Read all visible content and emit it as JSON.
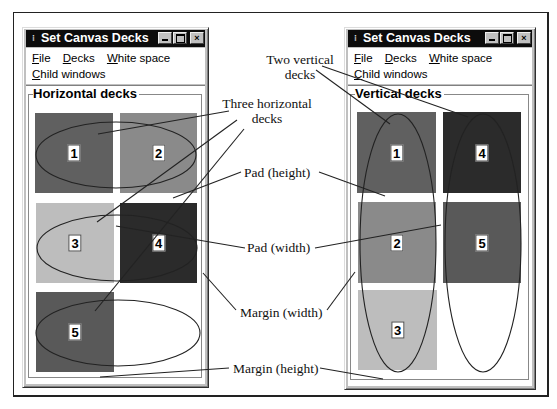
{
  "windows": {
    "left": {
      "title": "Set Canvas Decks",
      "menu": {
        "row1": [
          {
            "label": "File",
            "mnemonic": "F",
            "rest": "ile"
          },
          {
            "label": "Decks",
            "mnemonic": "D",
            "rest": "ecks"
          },
          {
            "label": "White space",
            "mnemonic": "W",
            "rest": "hite space"
          }
        ],
        "row2": [
          {
            "label": "Child windows",
            "mnemonic": "C",
            "rest": "hild windows"
          }
        ]
      },
      "group_label": "Horizontal decks",
      "decks": [
        {
          "num": "1",
          "color": "#606060"
        },
        {
          "num": "2",
          "color": "#8a8a8a"
        },
        {
          "num": "3",
          "color": "#bdbdbd"
        },
        {
          "num": "4",
          "color": "#2b2b2b"
        },
        {
          "num": "5",
          "color": "#595959"
        }
      ]
    },
    "right": {
      "title": "Set Canvas Decks",
      "menu": {
        "row1": [
          {
            "label": "File",
            "mnemonic": "F",
            "rest": "ile"
          },
          {
            "label": "Decks",
            "mnemonic": "D",
            "rest": "ecks"
          },
          {
            "label": "White space",
            "mnemonic": "W",
            "rest": "hite space"
          }
        ],
        "row2": [
          {
            "label": "Child windows",
            "mnemonic": "C",
            "rest": "hild windows"
          }
        ]
      },
      "group_label": "Vertical decks",
      "decks": [
        {
          "num": "1",
          "color": "#606060"
        },
        {
          "num": "4",
          "color": "#2b2b2b"
        },
        {
          "num": "2",
          "color": "#8a8a8a"
        },
        {
          "num": "5",
          "color": "#595959"
        },
        {
          "num": "3",
          "color": "#bdbdbd"
        }
      ]
    }
  },
  "titlebar_buttons": {
    "minimize": "minimize-icon",
    "maximize": "maximize-icon",
    "close": "×"
  },
  "annotations": {
    "two_vertical_1": "Two vertical",
    "two_vertical_2": "decks",
    "three_horizontal_1": "Three horizontal",
    "three_horizontal_2": "decks",
    "pad_height": "Pad (height)",
    "pad_width": "Pad (width)",
    "margin_width": "Margin (width)",
    "margin_height": "Margin (height)"
  },
  "colors": {
    "titlebar": "#0c0c0c",
    "window_face": "#c0c0c0",
    "deck_dark": "#2b2b2b",
    "deck_mid_dark": "#606060",
    "deck_mid": "#8a8a8a",
    "deck_light": "#bdbdbd"
  }
}
